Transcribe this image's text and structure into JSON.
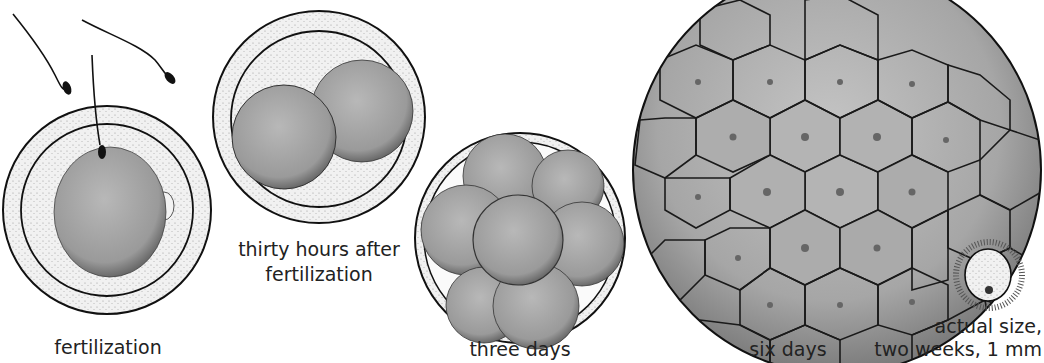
{
  "figure": {
    "stages": [
      {
        "id": "fertilization",
        "label": "fertilization"
      },
      {
        "id": "thirty-hours",
        "label_line1": "thirty hours after",
        "label_line2": "fertilization"
      },
      {
        "id": "three-days",
        "label": "three days"
      },
      {
        "id": "six-days",
        "label": "six days"
      },
      {
        "id": "two-weeks",
        "label_line1": "actual size,",
        "label_line2": "two weeks, 1 mm"
      }
    ]
  },
  "colors": {
    "outline": "#1a1a1a",
    "cell_fill": "#a9a9a9",
    "zona_fill": "#eeeeee",
    "background": "#ffffff"
  }
}
